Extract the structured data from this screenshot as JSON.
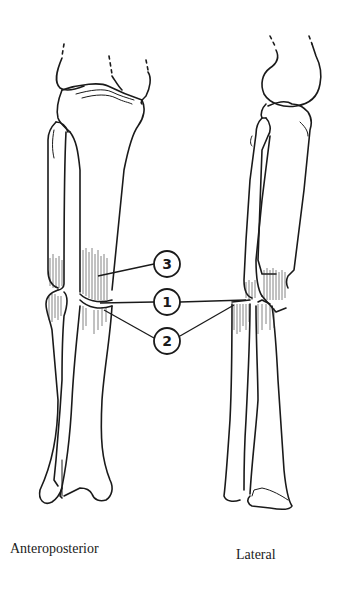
{
  "figure": {
    "views": [
      {
        "id": "anteroposterior",
        "label": "Anteroposterior"
      },
      {
        "id": "lateral",
        "label": "Lateral"
      }
    ],
    "callouts": [
      {
        "number": "3",
        "cx": 167,
        "cy": 264,
        "r": 13
      },
      {
        "number": "1",
        "cx": 167,
        "cy": 302,
        "r": 13
      },
      {
        "number": "2",
        "cx": 167,
        "cy": 341,
        "r": 13
      }
    ],
    "colors": {
      "line": "#1a1a1a",
      "background": "#ffffff"
    }
  }
}
